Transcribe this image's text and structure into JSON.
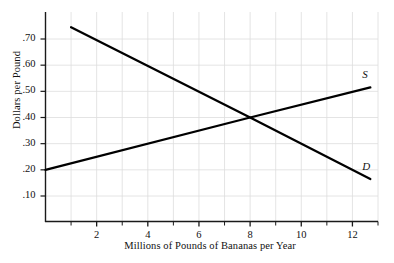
{
  "chart_data": {
    "type": "line",
    "title": "",
    "xlabel": "Millions of Pounds of Bananas per Year",
    "ylabel": "Dollars per Pound",
    "xlim": [
      0,
      13
    ],
    "ylim": [
      0,
      0.8
    ],
    "grid": true,
    "legend_position": "inline-end-of-line",
    "xticks": [
      2,
      4,
      6,
      8,
      10,
      12
    ],
    "xtick_labels": [
      "2",
      "4",
      "6",
      "8",
      "10",
      "12"
    ],
    "xminor_ticks": [
      1,
      3,
      5,
      7,
      9,
      11,
      13
    ],
    "yticks": [
      0.1,
      0.2,
      0.3,
      0.4,
      0.5,
      0.6,
      0.7
    ],
    "ytick_labels": [
      ".10",
      ".20",
      ".30",
      ".40",
      ".50",
      ".60",
      ".70"
    ],
    "series": [
      {
        "name": "S",
        "label": "S",
        "description": "Supply curve, upward sloping",
        "x": [
          0,
          8,
          12.7
        ],
        "values": [
          0.2,
          0.4,
          0.515
        ],
        "color": "#000000"
      },
      {
        "name": "D",
        "label": "D",
        "description": "Demand curve, downward sloping",
        "x": [
          1,
          8,
          12.7
        ],
        "values": [
          0.745,
          0.4,
          0.165
        ],
        "color": "#000000"
      }
    ],
    "annotations": [
      {
        "name": "equilibrium",
        "x": 8,
        "y": 0.4,
        "text": ""
      }
    ]
  },
  "style": {
    "axis_color": "#1a1a1a",
    "grid_color": "#dddddd",
    "line_color": "#000000",
    "text_color": "#111111",
    "background": "#ffffff"
  }
}
